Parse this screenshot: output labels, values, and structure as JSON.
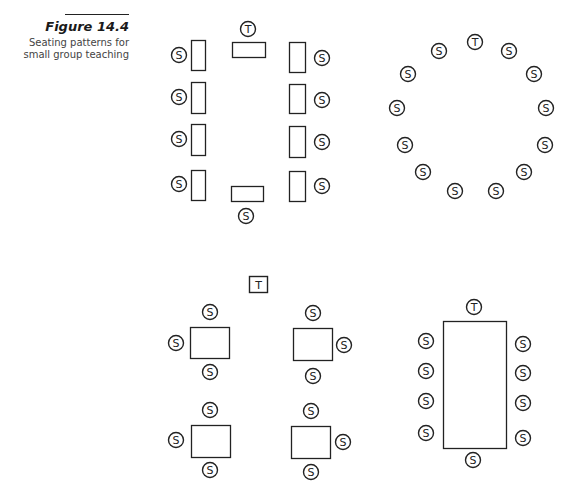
{
  "figure": {
    "label": "Figure 14.4",
    "caption": "Seating patterns for small group teaching"
  },
  "legend": {
    "student_marker": "S",
    "teacher_marker": "T"
  },
  "layouts": [
    {
      "id": "horseshoe-desks",
      "desks": [
        [
          191,
          40,
          14,
          30
        ],
        [
          191,
          82,
          14,
          31
        ],
        [
          191,
          124,
          14,
          31
        ],
        [
          191,
          170,
          14,
          30
        ],
        [
          289,
          42,
          16,
          30
        ],
        [
          289,
          84,
          16,
          29
        ],
        [
          289,
          126,
          16,
          31
        ],
        [
          289,
          171,
          16,
          30
        ],
        [
          232,
          42,
          33,
          15
        ],
        [
          231,
          186,
          32,
          15
        ]
      ],
      "seats": [
        {
          "x": 248,
          "y": 29,
          "label": "T"
        },
        {
          "x": 179,
          "y": 55,
          "label": "S"
        },
        {
          "x": 179,
          "y": 97,
          "label": "S"
        },
        {
          "x": 179,
          "y": 139,
          "label": "S"
        },
        {
          "x": 179,
          "y": 184,
          "label": "S"
        },
        {
          "x": 322,
          "y": 58,
          "label": "S"
        },
        {
          "x": 322,
          "y": 100,
          "label": "S"
        },
        {
          "x": 322,
          "y": 142,
          "label": "S"
        },
        {
          "x": 322,
          "y": 186,
          "label": "S"
        },
        {
          "x": 246,
          "y": 216,
          "label": "S"
        }
      ]
    },
    {
      "id": "circle",
      "desks": [],
      "seats": [
        {
          "x": 475,
          "y": 42,
          "label": "T"
        },
        {
          "x": 439,
          "y": 51,
          "label": "S"
        },
        {
          "x": 509,
          "y": 51,
          "label": "S"
        },
        {
          "x": 408,
          "y": 74,
          "label": "S"
        },
        {
          "x": 534,
          "y": 74,
          "label": "S"
        },
        {
          "x": 397,
          "y": 108,
          "label": "S"
        },
        {
          "x": 546,
          "y": 108,
          "label": "S"
        },
        {
          "x": 405,
          "y": 145,
          "label": "S"
        },
        {
          "x": 545,
          "y": 145,
          "label": "S"
        },
        {
          "x": 423,
          "y": 172,
          "label": "S"
        },
        {
          "x": 524,
          "y": 172,
          "label": "S"
        },
        {
          "x": 455,
          "y": 191,
          "label": "S"
        },
        {
          "x": 496,
          "y": 191,
          "label": "S"
        }
      ]
    },
    {
      "id": "four-small-tables",
      "teacher_box": {
        "x": 249,
        "y": 276,
        "w": 18,
        "h": 16,
        "label": "T"
      },
      "desks": [
        [
          190,
          327,
          39,
          31
        ],
        [
          293,
          328,
          39,
          32
        ],
        [
          191,
          425,
          39,
          32
        ],
        [
          291,
          426,
          39,
          32
        ]
      ],
      "seats": [
        {
          "x": 210,
          "y": 312,
          "label": "S"
        },
        {
          "x": 176,
          "y": 343,
          "label": "S"
        },
        {
          "x": 210,
          "y": 372,
          "label": "S"
        },
        {
          "x": 313,
          "y": 313,
          "label": "S"
        },
        {
          "x": 344,
          "y": 345,
          "label": "S"
        },
        {
          "x": 313,
          "y": 376,
          "label": "S"
        },
        {
          "x": 210,
          "y": 410,
          "label": "S"
        },
        {
          "x": 176,
          "y": 440,
          "label": "S"
        },
        {
          "x": 210,
          "y": 470,
          "label": "S"
        },
        {
          "x": 311,
          "y": 411,
          "label": "S"
        },
        {
          "x": 343,
          "y": 442,
          "label": "S"
        },
        {
          "x": 311,
          "y": 472,
          "label": "S"
        }
      ]
    },
    {
      "id": "boardroom-table",
      "desks": [
        [
          443,
          321,
          63,
          127
        ]
      ],
      "seats": [
        {
          "x": 474,
          "y": 307,
          "label": "T"
        },
        {
          "x": 426,
          "y": 341,
          "label": "S"
        },
        {
          "x": 426,
          "y": 371,
          "label": "S"
        },
        {
          "x": 426,
          "y": 401,
          "label": "S"
        },
        {
          "x": 426,
          "y": 433,
          "label": "S"
        },
        {
          "x": 523,
          "y": 344,
          "label": "S"
        },
        {
          "x": 523,
          "y": 373,
          "label": "S"
        },
        {
          "x": 523,
          "y": 403,
          "label": "S"
        },
        {
          "x": 523,
          "y": 438,
          "label": "S"
        },
        {
          "x": 473,
          "y": 460,
          "label": "S"
        }
      ]
    }
  ]
}
